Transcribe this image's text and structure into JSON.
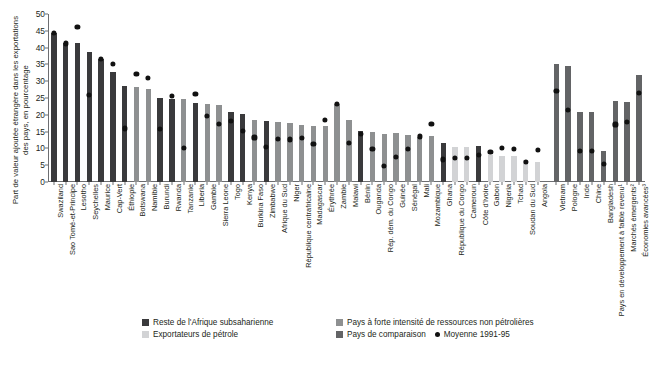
{
  "chart_data": {
    "type": "bar",
    "title": "",
    "xlabel": "",
    "ylabel": "Part de valeur ajoutée étrangère dans les exportations des pays, en pourcentage",
    "ylim": [
      0,
      50
    ],
    "yticks": [
      0,
      5,
      10,
      15,
      20,
      25,
      30,
      35,
      40,
      45,
      50
    ],
    "grid": false,
    "legend_position": "bottom",
    "categories": [
      "Swaziland",
      "Sao Tomé-et-Principe",
      "Lesotho",
      "Seychelles",
      "Maurice",
      "Cap-Vert",
      "Éthiopie",
      "Botswana",
      "Namibie",
      "Burundi",
      "Rwanda",
      "Tanzanie",
      "Liberia",
      "Gambie",
      "Sierra Leone",
      "Togo",
      "Kenya",
      "Burkina Faso",
      "Zimbabwe",
      "Afrique du Sud",
      "Niger",
      "République centrafricaine",
      "Madagascar",
      "Érythrée",
      "Zambie",
      "Malawi",
      "Bénin",
      "Ouganda",
      "Rép. dém. du Congo",
      "Guinée",
      "Sénégal",
      "Mali",
      "Mozambique",
      "Ghana",
      "République du Congo",
      "Cameroun",
      "Côte d'Ivoire",
      "Gabon",
      "Nigeria",
      "Tchad",
      "Soudan du Sud",
      "Angola",
      "Vietnam",
      "Pologne",
      "Inde",
      "Chine",
      "Bangladesh",
      "Pays en développement à faible revenu¹",
      "Marchés émergents²",
      "Économies avancées³"
    ],
    "series": [
      {
        "name": "Part de valeur ajoutée étrangère",
        "values": [
          44.3,
          41.3,
          41.4,
          38.6,
          36.6,
          32.7,
          28.7,
          28.4,
          27.8,
          24.9,
          24.8,
          24.8,
          23.6,
          23.1,
          23.0,
          20.7,
          20.3,
          18.5,
          18.1,
          17.8,
          17.6,
          17.0,
          16.8,
          16.6,
          23.3,
          18.5,
          15.1,
          15.0,
          14.4,
          14.6,
          14.1,
          13.5,
          13.6,
          11.7,
          10.3,
          10.5,
          10.6,
          8.1,
          7.6,
          7.8,
          6.5,
          6.0,
          35.0,
          34.6,
          20.8,
          20.9,
          9.1,
          24.1,
          23.7,
          31.8
        ],
        "groups": [
          "rest",
          "rest",
          "rest",
          "rest",
          "rest",
          "rest",
          "rest",
          "resource",
          "resource",
          "rest",
          "rest",
          "resource",
          "rest",
          "resource",
          "resource",
          "rest",
          "rest",
          "resource",
          "rest",
          "resource",
          "resource",
          "resource",
          "resource",
          "resource",
          "resource",
          "resource",
          "rest",
          "resource",
          "resource",
          "resource",
          "resource",
          "resource",
          "resource",
          "rest",
          "oil",
          "oil",
          "rest",
          "oil",
          "oil",
          "oil",
          "oil",
          "oil",
          "comparison",
          "comparison",
          "comparison",
          "comparison",
          "comparison",
          "comparison",
          "comparison",
          "comparison"
        ]
      },
      {
        "name": "Moyenne 1991-95",
        "values": [
          44.4,
          41.2,
          46.1,
          25.9,
          36.6,
          35.2,
          15.9,
          32.0,
          31.0,
          15.7,
          25.5,
          10.1,
          26.2,
          19.7,
          17.3,
          18.1,
          15.1,
          13.2,
          10.3,
          12.8,
          12.6,
          13.1,
          11.2,
          18.5,
          23.3,
          11.7,
          14.3,
          9.8,
          4.7,
          7.3,
          9.8,
          13.5,
          17.3,
          6.7,
          7.0,
          7.2,
          8.0,
          8.9,
          10.1,
          9.9,
          6.0,
          9.6,
          27.0,
          21.4,
          9.1,
          9.3,
          5.3,
          17.1,
          17.8,
          26.5
        ]
      }
    ],
    "legend": [
      {
        "label": "Reste de l'Afrique subsaharienne",
        "color": "#3a3a3c",
        "marker": "square",
        "key": "rest"
      },
      {
        "label": "Pays à forte intensité de ressources non pétrolières",
        "color": "#8e9091",
        "marker": "square",
        "key": "resource"
      },
      {
        "label": "Exportateurs de pétrole",
        "color": "#d2d3d5",
        "marker": "square",
        "key": "oil"
      },
      {
        "label": "Pays de comparaison",
        "color": "#636466",
        "marker": "square",
        "key": "comparison"
      },
      {
        "label": "Moyenne 1991-95",
        "color": "#111111",
        "marker": "dot",
        "key": "avg"
      }
    ],
    "colors": {
      "rest": "#3a3a3c",
      "resource": "#8e9091",
      "oil": "#d2d3d5",
      "comparison": "#636466",
      "avg_dot": "#111111",
      "axis": "#6d6e71",
      "text": "#231f20"
    },
    "group_gap_after_index": 41
  }
}
